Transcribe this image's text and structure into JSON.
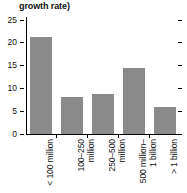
{
  "chart_data": {
    "type": "bar",
    "title": "growth rate)",
    "xlabel": "",
    "ylabel": "",
    "categories": [
      "< 100 million",
      "100–250\nmillion",
      "250–500\nmillion",
      "500 million–\n1 billion",
      "> 1 billion"
    ],
    "values": [
      21.2,
      8.0,
      8.7,
      14.4,
      5.9
    ],
    "ylim": [
      0,
      25
    ],
    "yticks": [
      0,
      5,
      10,
      15,
      20,
      25
    ],
    "ytick_labels": [
      "0",
      "5",
      "10",
      "15",
      "20",
      "25"
    ],
    "grid": false,
    "legend": "none",
    "bar_color": "#8a8a8a",
    "axis_color": "#000000"
  },
  "axis": {
    "ticks": [
      {
        "label": "25",
        "value": 25
      },
      {
        "label": "20",
        "value": 20
      },
      {
        "label": "15",
        "value": 15
      },
      {
        "label": "10",
        "value": 10
      },
      {
        "label": "5",
        "value": 5
      },
      {
        "label": "0",
        "value": 0
      }
    ]
  }
}
